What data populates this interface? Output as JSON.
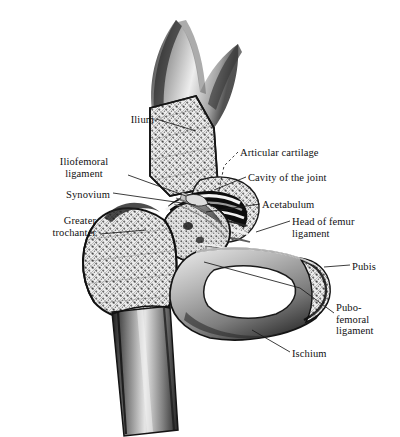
{
  "figure": {
    "style": "grayscale pen-and-ink anatomical illustration",
    "background_color": "#ffffff",
    "ink_color": "#111111",
    "width": 400,
    "height": 437
  },
  "labels": [
    {
      "id": "ilium",
      "text": "Ilium",
      "align": "right",
      "x": 98,
      "y": 114,
      "w": 56
    },
    {
      "id": "iliofemoral-ligament",
      "text": "Iliofemoral\nligament",
      "align": "center",
      "x": 44,
      "y": 156,
      "w": 80
    },
    {
      "id": "synovium",
      "text": "Synovium",
      "align": "right",
      "x": 38,
      "y": 189,
      "w": 72
    },
    {
      "id": "greater-trochanter",
      "text": "Greater\ntrochanter",
      "align": "right",
      "x": 18,
      "y": 215,
      "w": 78
    },
    {
      "id": "articular-cartilage",
      "text": "Articular cartilage",
      "align": "left",
      "x": 240,
      "y": 147,
      "w": 110
    },
    {
      "id": "cavity-of-the-joint",
      "text": "Cavity of  the joint",
      "align": "left",
      "x": 248,
      "y": 172,
      "w": 112
    },
    {
      "id": "acetabulum",
      "text": "Acetabulum",
      "align": "left",
      "x": 262,
      "y": 199,
      "w": 80
    },
    {
      "id": "head-of-femur-ligament",
      "text": "Head of femur\nligament",
      "align": "left",
      "x": 292,
      "y": 216,
      "w": 90
    },
    {
      "id": "pubis",
      "text": "Pubis",
      "align": "left",
      "x": 352,
      "y": 261,
      "w": 44
    },
    {
      "id": "pubofemoral-ligament",
      "text": "Pubo-\nfemoral\nligament",
      "align": "left",
      "x": 336,
      "y": 302,
      "w": 62
    },
    {
      "id": "ischium",
      "text": "Ischium",
      "align": "left",
      "x": 292,
      "y": 348,
      "w": 54
    }
  ],
  "leaders": [
    {
      "id": "leader-ilium",
      "style": "solid",
      "d": "M156,119 L196,131"
    },
    {
      "id": "leader-iliofemoral-ligament",
      "style": "solid",
      "d": "M128,175 L186,196"
    },
    {
      "id": "leader-synovium",
      "style": "solid",
      "d": "M113,193 L196,205"
    },
    {
      "id": "leader-greater-trochanter",
      "style": "solid",
      "d": "M100,234 L146,230"
    },
    {
      "id": "leader-articular-cartilage",
      "style": "dashed",
      "d": "M238,152 L224,166 L218,196"
    },
    {
      "id": "leader-cavity-of-the-joint",
      "style": "solid",
      "d": "M246,177 L214,190"
    },
    {
      "id": "leader-acetabulum",
      "style": "solid",
      "d": "M260,204 L206,212"
    },
    {
      "id": "leader-head-of-femur",
      "style": "solid",
      "d": "M290,221 L256,232"
    },
    {
      "id": "leader-pubis",
      "style": "solid",
      "d": "M350,265 L324,267"
    },
    {
      "id": "leader-pubofemoral-ligament",
      "style": "solid",
      "d": "M334,313 L300,288"
    },
    {
      "id": "leader-ischium",
      "style": "solid",
      "d": "M290,352 L252,330"
    },
    {
      "id": "leader-ischium-long",
      "style": "solid",
      "d": "M300,288 L204,262"
    }
  ]
}
